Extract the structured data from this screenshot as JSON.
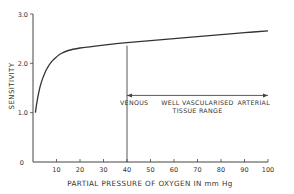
{
  "chart_data": {
    "type": "line",
    "title": "",
    "xlabel": "PARTIAL PRESSURE OF OXYGEN IN mm Hg",
    "ylabel": "SENSITIVITY",
    "xlim": [
      0,
      100
    ],
    "ylim": [
      0,
      3.0
    ],
    "x_ticks": [
      10,
      20,
      30,
      40,
      50,
      60,
      70,
      80,
      90,
      100
    ],
    "y_ticks": [
      {
        "value": 0,
        "label": "0"
      },
      {
        "value": 1.0,
        "label": "1.0"
      },
      {
        "value": 2.0,
        "label": "2.0"
      },
      {
        "value": 3.0,
        "label": "3.0"
      }
    ],
    "grid": false,
    "legend": null,
    "series": [
      {
        "name": "Sensitivity",
        "x": [
          1,
          2,
          3,
          4,
          5,
          6,
          8,
          10,
          12,
          15,
          20,
          25,
          30,
          40,
          50,
          60,
          70,
          80,
          90,
          100
        ],
        "y": [
          1.0,
          1.3,
          1.52,
          1.68,
          1.8,
          1.9,
          2.04,
          2.13,
          2.2,
          2.26,
          2.31,
          2.34,
          2.37,
          2.42,
          2.46,
          2.5,
          2.54,
          2.58,
          2.62,
          2.66
        ]
      }
    ],
    "annotations": {
      "venous_line_x": 40,
      "range_arrow": {
        "from": 40,
        "to": 100,
        "y": 1.35
      },
      "labels": [
        {
          "text": "VENOUS",
          "x": 40,
          "y": 1.2
        },
        {
          "text": "WELL VASCULARISED",
          "x": 70,
          "y": 1.2
        },
        {
          "text": "TISSUE RANGE",
          "x": 70,
          "y": 1.05
        },
        {
          "text": "ARTERIAL",
          "x": 100,
          "y": 1.2
        }
      ]
    }
  },
  "colors": {
    "line": "#333333",
    "axis": "#444444",
    "text": "#333333"
  }
}
